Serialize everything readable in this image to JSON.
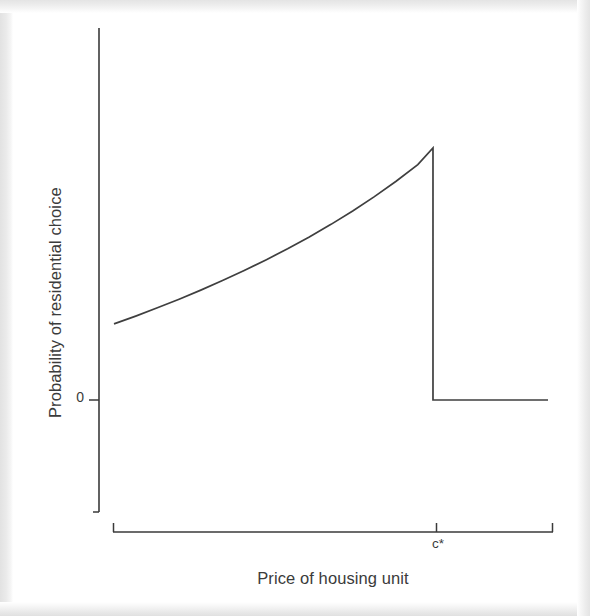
{
  "figure": {
    "background_color": "#ffffff",
    "border_color": "#e4e4e4",
    "line_color": "#3a3a3a"
  },
  "labels": {
    "y_axis_title": "Probability of residential choice",
    "x_axis_title": "Price of housing unit",
    "y_tick_zero": "0",
    "x_tick_cstar": "c*"
  },
  "chart_data": {
    "type": "line",
    "title": "",
    "subtitle": "",
    "xlabel": "Price of housing unit",
    "ylabel": "Probability of residential choice",
    "xlim": [
      0,
      1
    ],
    "ylim": [
      -0.35,
      1.3
    ],
    "grid": false,
    "legend": null,
    "annotations": [
      {
        "text": "c*",
        "x": 0.735,
        "y": -0.2,
        "note": "threshold price on x-axis"
      },
      {
        "text": "0",
        "x": -0.03,
        "y": 0,
        "note": "zero probability tick on y-axis"
      }
    ],
    "x_ticks": [
      {
        "value": 0.735,
        "label": "c*"
      }
    ],
    "y_ticks": [
      {
        "value": 0.0,
        "label": "0"
      }
    ],
    "series": [
      {
        "name": "Probability of residential choice",
        "description": "Convex increasing probability up to threshold c*, then discontinuous drop to zero",
        "points": [
          {
            "x": 0.0,
            "y": 0.302
          },
          {
            "x": 0.05,
            "y": 0.333
          },
          {
            "x": 0.1,
            "y": 0.366
          },
          {
            "x": 0.15,
            "y": 0.4
          },
          {
            "x": 0.2,
            "y": 0.436
          },
          {
            "x": 0.25,
            "y": 0.474
          },
          {
            "x": 0.3,
            "y": 0.514
          },
          {
            "x": 0.35,
            "y": 0.556
          },
          {
            "x": 0.4,
            "y": 0.6
          },
          {
            "x": 0.45,
            "y": 0.647
          },
          {
            "x": 0.5,
            "y": 0.697
          },
          {
            "x": 0.55,
            "y": 0.75
          },
          {
            "x": 0.6,
            "y": 0.807
          },
          {
            "x": 0.65,
            "y": 0.868
          },
          {
            "x": 0.7,
            "y": 0.934
          },
          {
            "x": 0.735,
            "y": 1.0
          },
          {
            "x": 0.735,
            "y": 0.0
          },
          {
            "x": 1.0,
            "y": 0.0
          }
        ],
        "discontinuity": {
          "at_x": 0.735,
          "from_y": 1.0,
          "to_y": 0.0
        }
      }
    ]
  },
  "geometry": {
    "y_axis": {
      "x": 99,
      "y_top": 28,
      "y_bottom": 512
    },
    "x_axis": {
      "y": 532,
      "x_left": 113,
      "x_right": 553
    },
    "zero_level_y": 400,
    "peak": {
      "x": 435,
      "y": 148
    },
    "curve_start": {
      "x": 114,
      "y": 328
    },
    "cstar_x": 436,
    "tail_end_x": 548
  }
}
